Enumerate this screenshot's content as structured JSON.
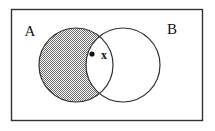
{
  "figure": {
    "type": "venn-diagram",
    "title": "",
    "universe": {
      "shape": "rectangle",
      "label": "",
      "border_color": "#333333",
      "fill_color": "#ffffff",
      "x": 11,
      "y": 9,
      "width": 192,
      "height": 112
    },
    "sets": [
      {
        "id": "A",
        "label": "A",
        "label_x": 30,
        "label_y": 36,
        "center_x": 76,
        "center_y": 65,
        "radius": 37,
        "stroke_color": "#333333",
        "fill_color": "#ffffff"
      },
      {
        "id": "B",
        "label": "B",
        "label_x": 172,
        "label_y": 34,
        "center_x": 123,
        "center_y": 65,
        "radius": 37,
        "stroke_color": "#333333",
        "fill_color": "#ffffff"
      }
    ],
    "shaded_region": {
      "id": "A-minus-B",
      "description": "A only",
      "pattern": "dot-screen",
      "pattern_color": "#6b6b6b",
      "pattern_background": "#ffffff"
    },
    "point": {
      "marker": "filled-dot",
      "marker_x": 92,
      "marker_y": 54,
      "marker_radius": 2.6,
      "marker_color": "#111111",
      "label": "x",
      "label_x": 101,
      "label_y": 59
    }
  }
}
